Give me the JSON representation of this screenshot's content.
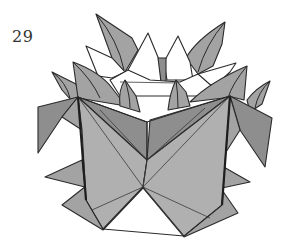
{
  "diagram": {
    "step_number": "29",
    "colors": {
      "paper_colored_side": "#a3a3a3",
      "paper_shadow": "#8e8e8e",
      "paper_white_side": "#ffffff",
      "outline": "#2a2a2a"
    }
  }
}
